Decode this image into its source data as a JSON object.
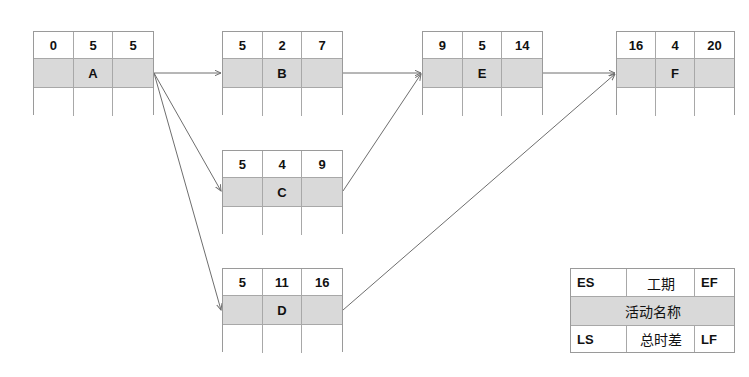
{
  "diagram": {
    "type": "activity-on-node network",
    "colors": {
      "edge": "#6e6e6e",
      "border": "#9a9a9a",
      "name_row_fill": "#d9d9d9",
      "text": "#111111"
    },
    "nodes": [
      {
        "id": "A",
        "es": "0",
        "duration": "5",
        "ef": "5",
        "ls": "",
        "float": "",
        "lf": ""
      },
      {
        "id": "B",
        "es": "5",
        "duration": "2",
        "ef": "7",
        "ls": "",
        "float": "",
        "lf": ""
      },
      {
        "id": "C",
        "es": "5",
        "duration": "4",
        "ef": "9",
        "ls": "",
        "float": "",
        "lf": ""
      },
      {
        "id": "D",
        "es": "5",
        "duration": "11",
        "ef": "16",
        "ls": "",
        "float": "",
        "lf": ""
      },
      {
        "id": "E",
        "es": "9",
        "duration": "5",
        "ef": "14",
        "ls": "",
        "float": "",
        "lf": ""
      },
      {
        "id": "F",
        "es": "16",
        "duration": "4",
        "ef": "20",
        "ls": "",
        "float": "",
        "lf": ""
      }
    ],
    "edges": [
      {
        "from": "A",
        "to": "B"
      },
      {
        "from": "A",
        "to": "C"
      },
      {
        "from": "A",
        "to": "D"
      },
      {
        "from": "B",
        "to": "E"
      },
      {
        "from": "C",
        "to": "E"
      },
      {
        "from": "E",
        "to": "F"
      },
      {
        "from": "D",
        "to": "F"
      }
    ]
  },
  "legend": {
    "es": "ES",
    "duration": "工期",
    "ef": "EF",
    "activity_name": "活动名称",
    "ls": "LS",
    "total_float": "总时差",
    "lf": "LF"
  }
}
